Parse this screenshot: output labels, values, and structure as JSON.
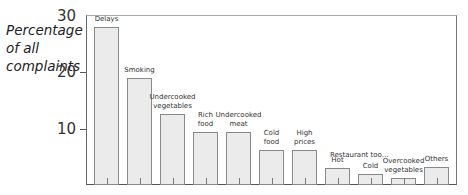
{
  "chart_data": {
    "type": "bar",
    "title": "",
    "xlabel": "",
    "ylabel": "Percentage of all complaints",
    "ylabel_lines": [
      "Percentage",
      "of all",
      "complaints"
    ],
    "ylim": [
      0,
      30
    ],
    "yticks": [
      10,
      20,
      30
    ],
    "grid": false,
    "legend": null,
    "group_annotation": "Restaurant too...",
    "categories": [
      "Delays",
      "Smoking",
      "Undercooked vegetables",
      "Rich food",
      "Undercooked meat",
      "Cold food",
      "High prices",
      "Hot",
      "Cold",
      "Overcooked vegetables",
      "Others"
    ],
    "category_label_lines": [
      [
        "Delays"
      ],
      [
        "Smoking"
      ],
      [
        "Undercooked",
        "vegetables"
      ],
      [
        "Rich",
        "food"
      ],
      [
        "Undercooked",
        "meat"
      ],
      [
        "Cold",
        "food"
      ],
      [
        "High",
        "prices"
      ],
      [
        "Hot"
      ],
      [
        "Cold"
      ],
      [
        "Overcooked",
        "vegetables"
      ],
      [
        "Others"
      ]
    ],
    "values": [
      28,
      19,
      12.5,
      9.4,
      9.4,
      6.2,
      6.2,
      3.0,
      2.0,
      1.2,
      3.2
    ]
  },
  "colors": {
    "bar_fill": "#ebebeb",
    "bar_border": "#888888",
    "axis": "#555555"
  }
}
